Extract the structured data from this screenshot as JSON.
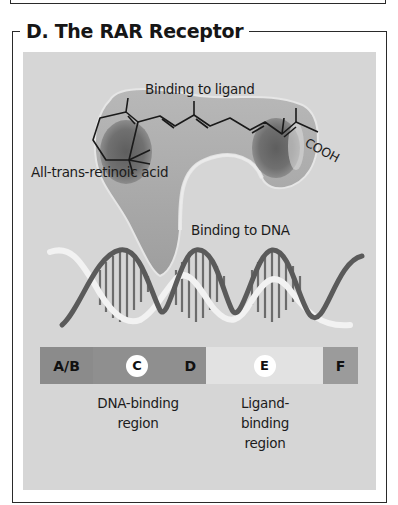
{
  "figure": {
    "panel_title": "D. The RAR Receptor",
    "labels": {
      "ligand_binding": "Binding to ligand",
      "molecule_name": "All-trans-retinoic acid",
      "carboxyl_group": "COOH",
      "dna_binding": "Binding to DNA"
    },
    "domains": [
      {
        "id": "A/B",
        "label": "A/B",
        "circled": false,
        "color": "#8b8b8b"
      },
      {
        "id": "C",
        "label": "C",
        "circled": true,
        "color": "#8f8f8f"
      },
      {
        "id": "D",
        "label": "D",
        "circled": false,
        "color": "#8f8f8f"
      },
      {
        "id": "E",
        "label": "E",
        "circled": true,
        "color": "#e2e2e2"
      },
      {
        "id": "F",
        "label": "F",
        "circled": false,
        "color": "#9b9b9b"
      }
    ],
    "regions": {
      "dna_binding": {
        "line1": "DNA-binding",
        "line2": "region"
      },
      "ligand_binding": {
        "line1": "Ligand-",
        "line2": "binding",
        "line3": "region"
      }
    },
    "colors": {
      "panel_background": "#d6d6d6",
      "protein": "#a9a9a9",
      "dna_dark_strand": "#5a5a5a",
      "dna_light_strand": "#f0f0f0",
      "frame": "#2a2a2a"
    }
  }
}
